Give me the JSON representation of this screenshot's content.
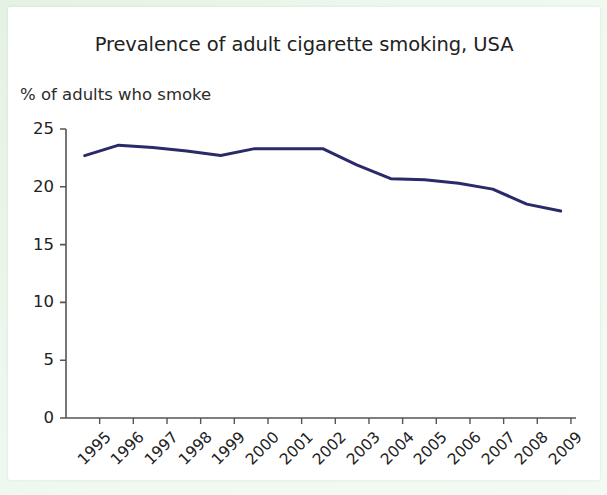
{
  "chart_data": {
    "type": "line",
    "title": "Prevalence of adult cigarette smoking, USA",
    "subtitle": "% of adults who smoke",
    "ylabel": "% of adults who smoke",
    "xlabel": "",
    "ylim": [
      0,
      25
    ],
    "yticks": [
      0,
      5,
      10,
      15,
      20,
      25
    ],
    "ytick_labels": [
      "0",
      "5",
      "10",
      "15",
      "20",
      "25"
    ],
    "grid": false,
    "legend": "none",
    "categories": [
      "1995",
      "1996",
      "1997",
      "1998",
      "1999",
      "2000",
      "2001",
      "2002",
      "2003",
      "2004",
      "2005",
      "2006",
      "2007",
      "2008",
      "2009"
    ],
    "x": [
      1995,
      1996,
      1997,
      1998,
      1999,
      2000,
      2001,
      2002,
      2003,
      2004,
      2005,
      2006,
      2007,
      2008,
      2009
    ],
    "values": [
      22.7,
      23.6,
      23.4,
      23.1,
      22.7,
      23.3,
      23.3,
      23.3,
      21.9,
      20.7,
      20.6,
      20.3,
      19.8,
      18.5,
      17.9
    ],
    "series": [
      {
        "name": "% of adults who smoke",
        "color": "#2a2a6a",
        "values": [
          22.7,
          23.6,
          23.4,
          23.1,
          22.7,
          23.3,
          23.3,
          23.3,
          21.9,
          20.7,
          20.6,
          20.3,
          19.8,
          18.5,
          17.9
        ]
      }
    ]
  },
  "style": {
    "line_color": "#2a2a6a",
    "axis_color": "#555555",
    "text_color": "#222222",
    "card_background": "#ffffff",
    "frame_background": "#e8f4e8"
  }
}
